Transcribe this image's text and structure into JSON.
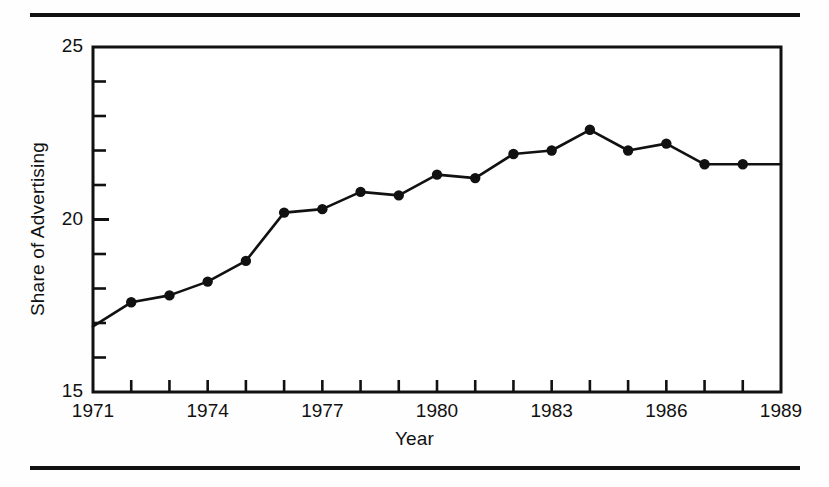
{
  "figure": {
    "rules": {
      "top": "horizontal-rule",
      "bottom": "horizontal-rule"
    }
  },
  "chart_data": {
    "type": "line",
    "title": "",
    "xlabel": "Year",
    "ylabel": "Share of Advertising",
    "xlim": [
      1971,
      1989
    ],
    "ylim": [
      15,
      25
    ],
    "grid": false,
    "legend": null,
    "marker": "filled-circle",
    "line_color": "#111111",
    "marker_color": "#111111",
    "x_tick_labels": [
      "1971",
      "1974",
      "1977",
      "1980",
      "1983",
      "1986",
      "1989"
    ],
    "x_tick_values": [
      1971,
      1974,
      1977,
      1980,
      1983,
      1986,
      1989
    ],
    "x_minor_ticks": [
      1971,
      1972,
      1973,
      1974,
      1975,
      1976,
      1977,
      1978,
      1979,
      1980,
      1981,
      1982,
      1983,
      1984,
      1985,
      1986,
      1987,
      1988,
      1989
    ],
    "y_tick_labels": [
      "15",
      "20",
      "25"
    ],
    "y_tick_values": [
      15,
      20,
      25
    ],
    "y_minor_ticks": [
      16,
      17,
      18,
      19,
      21,
      22,
      23,
      24
    ],
    "x": [
      1971,
      1972,
      1973,
      1974,
      1975,
      1976,
      1977,
      1978,
      1979,
      1980,
      1981,
      1982,
      1983,
      1984,
      1985,
      1986,
      1987,
      1988,
      1989
    ],
    "values": [
      16.9,
      17.6,
      17.8,
      18.2,
      18.8,
      20.2,
      20.3,
      20.8,
      20.7,
      21.3,
      21.2,
      21.9,
      22.0,
      22.6,
      22.0,
      22.2,
      21.6,
      21.6,
      21.6
    ],
    "markers_shown_at": [
      1972,
      1973,
      1974,
      1975,
      1976,
      1977,
      1978,
      1979,
      1980,
      1981,
      1982,
      1983,
      1984,
      1985,
      1986,
      1987,
      1988
    ],
    "series": [
      {
        "name": "Share of Advertising",
        "values": [
          16.9,
          17.6,
          17.8,
          18.2,
          18.8,
          20.2,
          20.3,
          20.8,
          20.7,
          21.3,
          21.2,
          21.9,
          22.0,
          22.6,
          22.0,
          22.2,
          21.6,
          21.6,
          21.6
        ]
      }
    ]
  }
}
